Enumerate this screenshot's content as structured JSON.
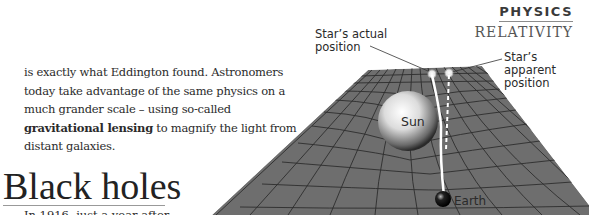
{
  "header": {
    "section": "PHYSICS",
    "subsection": "RELATIVITY"
  },
  "article": {
    "paragraph_before_bold": "is exactly what Eddington found. Astronomers today take advantage of the same physics on a much grander scale – using so-called ",
    "bold_term": "gravitational lensing",
    "paragraph_after_bold": " to magnify the light from distant galaxies.",
    "heading": "Black holes",
    "next_paragraph_start": "In 1916, just a year after"
  },
  "diagram": {
    "labels": {
      "star_actual": "Star’s actual position",
      "star_apparent": "Star’s apparent position",
      "sun": "Sun",
      "earth": "Earth"
    },
    "colors": {
      "grid_surface": "#6e6e6e",
      "grid_lines": "#2e2e2e",
      "light_ray": "#ffffff",
      "sun": "#d9d9d9",
      "earth": "#111111"
    }
  }
}
